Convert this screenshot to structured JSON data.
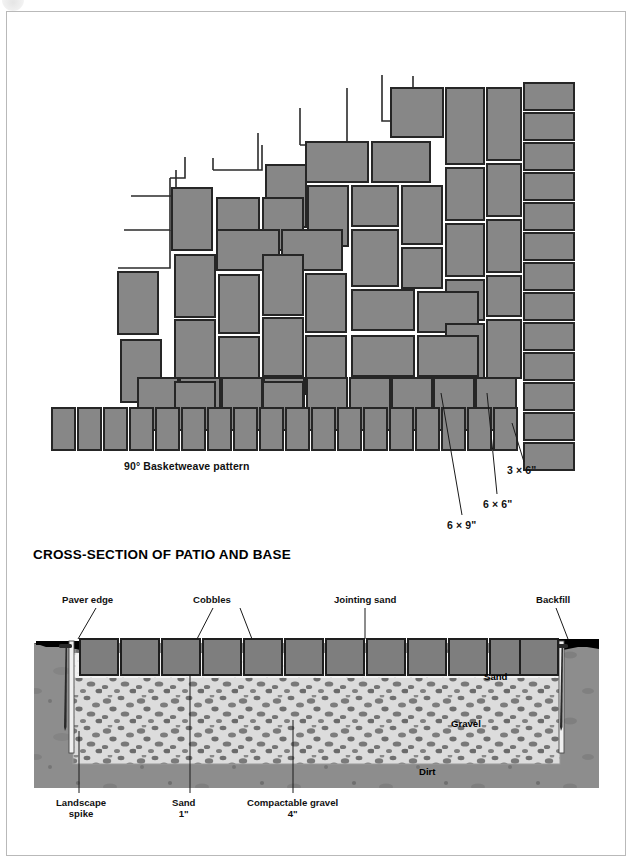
{
  "page": {
    "corner_badge": "circle-badge"
  },
  "pattern_figure": {
    "caption": "90° Basketweave pattern",
    "callouts": [
      {
        "id": "6x9",
        "label": "6 × 9\""
      },
      {
        "id": "6x6",
        "label": "6 × 6\""
      },
      {
        "id": "3x6",
        "label": "3 × 6\""
      }
    ],
    "colors": {
      "paver_fill": "#878787",
      "paver_stroke": "#262626",
      "outline_stroke": "#2b2b2b",
      "leader_line": "#1a1a1a"
    },
    "paver_sizes": {
      "six_by_nine": "6 × 9\"",
      "six_by_six": "6 × 6\"",
      "three_by_six": "3 × 6\""
    }
  },
  "cross_section": {
    "heading": "CROSS-SECTION OF PATIO AND BASE",
    "top_labels": [
      {
        "id": "paver-edge",
        "label": "Paver edge"
      },
      {
        "id": "cobbles",
        "label": "Cobbles"
      },
      {
        "id": "jointing-sand",
        "label": "Jointing sand"
      },
      {
        "id": "backfill",
        "label": "Backfill"
      }
    ],
    "bottom_labels": [
      {
        "id": "landscape-spike",
        "line1": "Landscape",
        "line2": "spike"
      },
      {
        "id": "sand",
        "line1": "Sand",
        "line2": "1\""
      },
      {
        "id": "compactable-gravel",
        "line1": "Compactable gravel",
        "line2": "4\""
      }
    ],
    "inline_labels": [
      {
        "id": "sand",
        "label": "Sand"
      },
      {
        "id": "gravel",
        "label": "Gravel"
      },
      {
        "id": "dirt",
        "label": "Dirt"
      }
    ],
    "layers": {
      "sand_depth": "1\"",
      "gravel_depth": "4\""
    },
    "cobble_count": 12,
    "colors": {
      "dirt": "#8d8d8d",
      "gravel_bg": "#dcdcdc",
      "gravel_stone": "#7a7a7a",
      "sand": "#f2f2f2",
      "cobble_fill": "#7e7e7e",
      "cobble_stroke": "#1e1e1e",
      "backfill": "#000000",
      "spike": "#2a2a2a"
    }
  }
}
